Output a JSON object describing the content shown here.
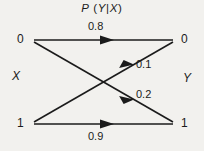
{
  "figure": {
    "kind": "probability-transition-diagram",
    "background_color": "#f2f1ee",
    "ink_color": "#1b1b1b",
    "width": 204,
    "height": 151
  },
  "title": {
    "full": "P (Y|X)",
    "p": "P",
    "open_paren": "(",
    "y": "Y",
    "bar": "|",
    "x": "X",
    "close_paren": ")"
  },
  "axes_labels": {
    "input_variable": "X",
    "output_variable": "Y"
  },
  "nodes": {
    "input": [
      {
        "id": "x0",
        "label": "0",
        "x": 33,
        "y": 40
      },
      {
        "id": "x1",
        "label": "1",
        "x": 33,
        "y": 124
      }
    ],
    "output": [
      {
        "id": "y0",
        "label": "0",
        "x": 173,
        "y": 40
      },
      {
        "id": "y1",
        "label": "1",
        "x": 173,
        "y": 124
      }
    ]
  },
  "edges": [
    {
      "id": "x0-y0",
      "from": "x0",
      "to": "y0",
      "label": "0.8",
      "label_x": 100,
      "label_y": 28,
      "arrow_t": 0.52
    },
    {
      "id": "x0-y1",
      "from": "x0",
      "to": "y1",
      "label": "0.2",
      "label_x": 145,
      "label_y": 95,
      "arrow_t": 0.7
    },
    {
      "id": "x1-y0",
      "from": "x1",
      "to": "y0",
      "label": "0.1",
      "label_x": 145,
      "label_y": 65,
      "arrow_t": 0.7
    },
    {
      "id": "x1-y1",
      "from": "x1",
      "to": "y1",
      "label": "0.9",
      "label_x": 100,
      "label_y": 137,
      "arrow_t": 0.52
    }
  ],
  "chart_data": {
    "type": "diagram",
    "xlabel": "X",
    "ylabel": "Y",
    "categories": [
      "0",
      "1"
    ],
    "matrix_rows": [
      "X=0",
      "X=1"
    ],
    "matrix_cols": [
      "Y=0",
      "Y=1"
    ],
    "values": [
      [
        0.8,
        0.2
      ],
      [
        0.1,
        0.9
      ]
    ],
    "transitions": [
      {
        "from": "X=0",
        "to": "Y=0",
        "probability": 0.8
      },
      {
        "from": "X=0",
        "to": "Y=1",
        "probability": 0.2
      },
      {
        "from": "X=1",
        "to": "Y=0",
        "probability": 0.1
      },
      {
        "from": "X=1",
        "to": "Y=1",
        "probability": 0.9
      }
    ],
    "legend": [],
    "grid": false
  }
}
